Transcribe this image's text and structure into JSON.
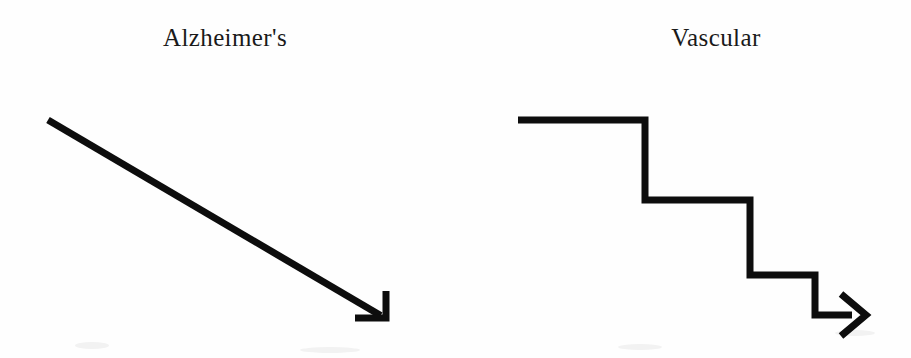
{
  "figure": {
    "background_color": "#fefefe",
    "stroke_color": "#0d0d0d",
    "panels": [
      {
        "id": "alzheimers",
        "label": "Alzheimer's",
        "label_x": 225,
        "trajectory_type": "smooth-linear-decline",
        "arrowhead_style": "open-barb"
      },
      {
        "id": "vascular",
        "label": "Vascular",
        "label_x": 716,
        "trajectory_type": "stepwise-decline",
        "step_count": 3,
        "arrowhead_style": "open-barb"
      }
    ]
  },
  "chart_data": {
    "type": "line",
    "title": "",
    "xlabel": "",
    "ylabel": "",
    "grid": false,
    "legend_position": "top",
    "series": [
      {
        "name": "Alzheimer's",
        "style": "smooth steady linear decline",
        "points": [
          {
            "x": 48,
            "y": 120
          },
          {
            "x": 385,
            "y": 318
          }
        ]
      },
      {
        "name": "Vascular",
        "style": "stepwise stair-step decline",
        "points": [
          {
            "x": 518,
            "y": 120
          },
          {
            "x": 645,
            "y": 120
          },
          {
            "x": 645,
            "y": 200
          },
          {
            "x": 750,
            "y": 200
          },
          {
            "x": 750,
            "y": 275
          },
          {
            "x": 815,
            "y": 275
          },
          {
            "x": 815,
            "y": 315
          },
          {
            "x": 866,
            "y": 315
          }
        ]
      }
    ]
  }
}
